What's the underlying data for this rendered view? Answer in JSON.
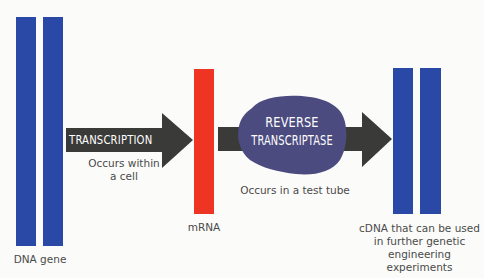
{
  "diagram": {
    "colors": {
      "dna_blue": "#2a48a6",
      "mrna_red": "#ee3524",
      "arrow_dark": "#3a3a38",
      "enzyme_purple": "#4c4b7f",
      "label_gray": "#4a4a4a",
      "background": "#fbfbf9"
    },
    "nodes": {
      "dna_gene": {
        "label": "DNA gene",
        "strands": 2
      },
      "mrna": {
        "label": "mRNA",
        "strands": 1
      },
      "cdna": {
        "label_lines": [
          "cDNA that can be used",
          "in further genetic",
          "engineering experiments"
        ],
        "strands": 2
      }
    },
    "steps": {
      "transcription": {
        "label": "TRANSCRIPTION",
        "note_lines": [
          "Occurs within",
          "a cell"
        ]
      },
      "reverse_transcription": {
        "enzyme_lines": [
          "REVERSE",
          "TRANSCRIPTASE"
        ],
        "note": "Occurs in a test tube"
      }
    }
  }
}
